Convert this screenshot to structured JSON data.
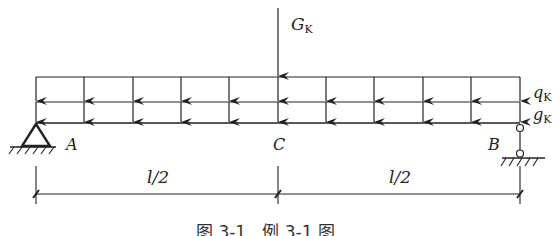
{
  "diagram": {
    "type": "simply-supported beam load diagram",
    "loads": {
      "point_load": {
        "symbol": "G",
        "subscript": "K",
        "position": "C (midspan)"
      },
      "distributed_upper": {
        "symbol": "q",
        "subscript": "K"
      },
      "distributed_lower": {
        "symbol": "g",
        "subscript": "K"
      }
    },
    "points": {
      "left": "A",
      "middle": "C",
      "right": "B"
    },
    "supports": {
      "left": "pin support",
      "right": "roller (link) support"
    },
    "dimensions": [
      {
        "label": "l/2",
        "from": "A",
        "to": "C"
      },
      {
        "label": "l/2",
        "from": "C",
        "to": "B"
      }
    ],
    "caption": "图 3-1   例 3-1 图",
    "colors": {
      "line": "#222222",
      "background": "#ffffff"
    }
  }
}
